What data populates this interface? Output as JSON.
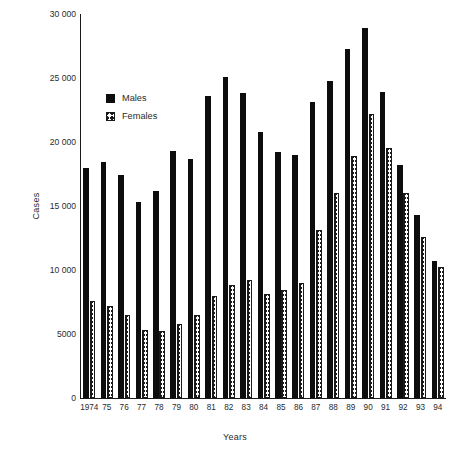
{
  "chart_data": {
    "type": "bar",
    "title": "",
    "subtitle": "",
    "xlabel": "Years",
    "ylabel": "Cases",
    "categories": [
      "1974",
      "75",
      "76",
      "77",
      "78",
      "79",
      "80",
      "81",
      "82",
      "83",
      "84",
      "85",
      "86",
      "87",
      "88",
      "89",
      "90",
      "91",
      "92",
      "93",
      "94"
    ],
    "series": [
      {
        "name": "Males",
        "color": "#0d0d0d",
        "pattern": "solid",
        "values": [
          18000,
          18400,
          17400,
          15300,
          16200,
          19300,
          18700,
          23600,
          25100,
          23800,
          20800,
          19200,
          19000,
          23100,
          24800,
          27300,
          28900,
          23900,
          18200,
          14300,
          10700
        ]
      },
      {
        "name": "Females",
        "color": "#1a1a1a",
        "pattern": "cross-hatch",
        "values": [
          7600,
          7200,
          6500,
          5300,
          5200,
          5800,
          6500,
          8000,
          8800,
          9200,
          8100,
          8400,
          9000,
          13100,
          16000,
          18900,
          22200,
          19500,
          16000,
          12600,
          10200
        ]
      }
    ],
    "ylim": [
      0,
      30000
    ],
    "yticks": [
      0,
      5000,
      10000,
      15000,
      20000,
      25000,
      30000
    ],
    "ytick_labels": [
      "0",
      "5000",
      "10 000",
      "15 000",
      "20 000",
      "25 000",
      "30 000"
    ],
    "grid": false,
    "legend_position": "upper-left-inside",
    "legend": [
      {
        "label": "Males",
        "swatch": "solid-black-square"
      },
      {
        "label": "Females",
        "swatch": "cross-hatched-square"
      }
    ]
  }
}
